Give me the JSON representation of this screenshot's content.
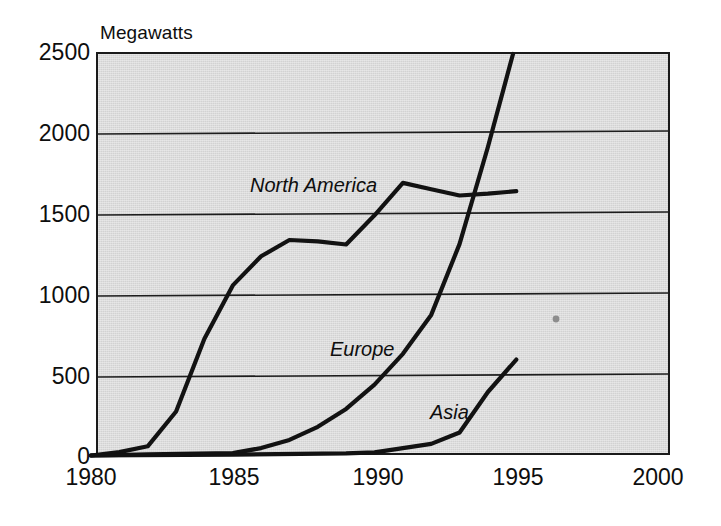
{
  "chart_data": {
    "type": "line",
    "title": "",
    "ylabel": "Megawatts",
    "xlabel": "",
    "xlim": [
      1980,
      2000
    ],
    "ylim": [
      0,
      2500
    ],
    "grid": true,
    "legend_position": "inline-series-labels",
    "xticks": [
      "1980",
      "1985",
      "1990",
      "1995",
      "2000"
    ],
    "xtick_values": [
      1980,
      1985,
      1990,
      1995,
      2000
    ],
    "yticks": [
      "0",
      "500",
      "1000",
      "1500",
      "2000",
      "2500"
    ],
    "ytick_values": [
      0,
      500,
      1000,
      1500,
      2000,
      2500
    ],
    "series": [
      {
        "name": "North America",
        "x": [
          1980,
          1981,
          1982,
          1983,
          1984,
          1985,
          1986,
          1987,
          1988,
          1989,
          1990,
          1991,
          1992,
          1993,
          1994,
          1995
        ],
        "values": [
          0,
          20,
          55,
          270,
          720,
          1050,
          1230,
          1330,
          1320,
          1300,
          1480,
          1680,
          1640,
          1600,
          1610,
          1625
        ]
      },
      {
        "name": "Europe",
        "x": [
          1980,
          1982,
          1985,
          1986,
          1987,
          1988,
          1989,
          1990,
          1991,
          1992,
          1993,
          1994,
          1995
        ],
        "values": [
          0,
          5,
          10,
          40,
          90,
          170,
          280,
          430,
          620,
          860,
          1300,
          1900,
          2550
        ]
      },
      {
        "name": "Asia",
        "x": [
          1980,
          1985,
          1989,
          1990,
          1991,
          1992,
          1993,
          1994,
          1995
        ],
        "values": [
          0,
          0,
          5,
          10,
          35,
          60,
          130,
          380,
          580
        ]
      }
    ]
  },
  "labels": {
    "axis_title": "Megawatts",
    "north_america": "North America",
    "europe": "Europe",
    "asia": "Asia"
  },
  "colors": {
    "plot_background": "#d2d2d2",
    "line": "#121212",
    "grid": "#1d1d1d",
    "text": "#0e0e0e",
    "page_background": "#ffffff"
  }
}
